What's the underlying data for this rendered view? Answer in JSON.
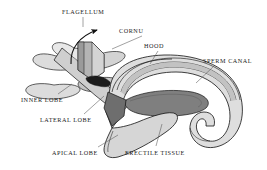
{
  "figure": {
    "type": "anatomical-diagram",
    "background_color": "#ffffff",
    "outline_color": "#111111",
    "labels": [
      {
        "id": "flagellum",
        "text": "FLAGELLUM",
        "x": 62,
        "y": 9,
        "leader": "vertical-then-curved-arrow"
      },
      {
        "id": "cornu",
        "text": "CORNU",
        "x": 119,
        "y": 28,
        "leader": "diagonal-down-left"
      },
      {
        "id": "hood",
        "text": "HOOD",
        "x": 144,
        "y": 43,
        "leader": "diagonal-down-left"
      },
      {
        "id": "sperm-canal",
        "text": "SPERM CANAL",
        "x": 203,
        "y": 58,
        "leader": "diagonal-down-left"
      },
      {
        "id": "inner-lobe",
        "text": "INNER LOBE",
        "x": 21,
        "y": 97,
        "leader": "diagonal-up-right"
      },
      {
        "id": "lateral-lobe",
        "text": "LATERAL LOBE",
        "x": 40,
        "y": 117,
        "leader": "diagonal-up-right"
      },
      {
        "id": "apical-lobe",
        "text": "APICAL LOBE",
        "x": 52,
        "y": 150,
        "leader": "diagonal-up-right"
      },
      {
        "id": "erectile-tissue",
        "text": "ERECTILE TISSUE",
        "x": 125,
        "y": 150,
        "leader": "vertical-up"
      }
    ],
    "palette": {
      "outline": "#111111",
      "fill_lightest": "#ffffff",
      "fill_light": "#e4e4e4",
      "fill_mid": "#c9c9c9",
      "fill_mid_dark": "#a8a8a8",
      "fill_dark": "#7d7d7d",
      "fill_darkest": "#4a4a4a",
      "fill_black": "#1c1c1c"
    }
  }
}
